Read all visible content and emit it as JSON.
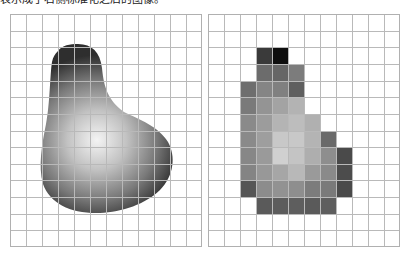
{
  "caption": "表示成了右侧标准化之后的图像。",
  "figure": {
    "grid": {
      "cols": 12,
      "rows": 14,
      "line_color": "#b9b9b9"
    },
    "left_panel": {
      "label": "continuous-shape",
      "description": "Smooth grey pear-shaped blob with radial shading, brightest near center-lower region",
      "fill_highlight": "#f2f2f2",
      "fill_mid": "#a8a8a8",
      "fill_edge": "#3a3a3a"
    },
    "right_panel": {
      "label": "pixelated-shape",
      "description": "Same shape discretized into grid cells with grey levels",
      "cells": [
        {
          "row": 2,
          "col": 3,
          "color": "#3a3a3a"
        },
        {
          "row": 2,
          "col": 4,
          "color": "#0e0e0e"
        },
        {
          "row": 3,
          "col": 3,
          "color": "#6c6c6c"
        },
        {
          "row": 3,
          "col": 4,
          "color": "#666666"
        },
        {
          "row": 3,
          "col": 5,
          "color": "#7c7c7c"
        },
        {
          "row": 4,
          "col": 2,
          "color": "#6e6e6e"
        },
        {
          "row": 4,
          "col": 3,
          "color": "#858585"
        },
        {
          "row": 4,
          "col": 4,
          "color": "#808080"
        },
        {
          "row": 4,
          "col": 5,
          "color": "#5f5f5f"
        },
        {
          "row": 5,
          "col": 2,
          "color": "#7a7a7a"
        },
        {
          "row": 5,
          "col": 3,
          "color": "#949494"
        },
        {
          "row": 5,
          "col": 4,
          "color": "#a3a3a3"
        },
        {
          "row": 5,
          "col": 5,
          "color": "#b3b3b3"
        },
        {
          "row": 6,
          "col": 2,
          "color": "#8a8a8a"
        },
        {
          "row": 6,
          "col": 3,
          "color": "#9c9c9c"
        },
        {
          "row": 6,
          "col": 4,
          "color": "#b4b4b4"
        },
        {
          "row": 6,
          "col": 5,
          "color": "#bdbdbd"
        },
        {
          "row": 6,
          "col": 6,
          "color": "#b0b0b0"
        },
        {
          "row": 7,
          "col": 2,
          "color": "#8a8a8a"
        },
        {
          "row": 7,
          "col": 3,
          "color": "#9e9e9e"
        },
        {
          "row": 7,
          "col": 4,
          "color": "#c8c8c8"
        },
        {
          "row": 7,
          "col": 5,
          "color": "#c8c8c8"
        },
        {
          "row": 7,
          "col": 6,
          "color": "#b4b4b4"
        },
        {
          "row": 7,
          "col": 7,
          "color": "#6a6a6a"
        },
        {
          "row": 8,
          "col": 2,
          "color": "#878787"
        },
        {
          "row": 8,
          "col": 3,
          "color": "#9a9a9a"
        },
        {
          "row": 8,
          "col": 4,
          "color": "#d0d0d0"
        },
        {
          "row": 8,
          "col": 5,
          "color": "#c4c4c4"
        },
        {
          "row": 8,
          "col": 6,
          "color": "#aeaeae"
        },
        {
          "row": 8,
          "col": 7,
          "color": "#8e8e8e"
        },
        {
          "row": 8,
          "col": 8,
          "color": "#4a4a4a"
        },
        {
          "row": 9,
          "col": 2,
          "color": "#848484"
        },
        {
          "row": 9,
          "col": 3,
          "color": "#989898"
        },
        {
          "row": 9,
          "col": 4,
          "color": "#a6a6a6"
        },
        {
          "row": 9,
          "col": 5,
          "color": "#b8b8b8"
        },
        {
          "row": 9,
          "col": 6,
          "color": "#9a9a9a"
        },
        {
          "row": 9,
          "col": 7,
          "color": "#8a8a8a"
        },
        {
          "row": 9,
          "col": 8,
          "color": "#4c4c4c"
        },
        {
          "row": 10,
          "col": 2,
          "color": "#555555"
        },
        {
          "row": 10,
          "col": 3,
          "color": "#8c8c8c"
        },
        {
          "row": 10,
          "col": 4,
          "color": "#929292"
        },
        {
          "row": 10,
          "col": 5,
          "color": "#8e8e8e"
        },
        {
          "row": 10,
          "col": 6,
          "color": "#7c7c7c"
        },
        {
          "row": 10,
          "col": 7,
          "color": "#7a7a7a"
        },
        {
          "row": 10,
          "col": 8,
          "color": "#4a4a4a"
        },
        {
          "row": 11,
          "col": 3,
          "color": "#5a5a5a"
        },
        {
          "row": 11,
          "col": 4,
          "color": "#5c5c5c"
        },
        {
          "row": 11,
          "col": 5,
          "color": "#5e5e5e"
        },
        {
          "row": 11,
          "col": 6,
          "color": "#5a5a5a"
        },
        {
          "row": 11,
          "col": 7,
          "color": "#5e5e5e"
        }
      ]
    }
  }
}
